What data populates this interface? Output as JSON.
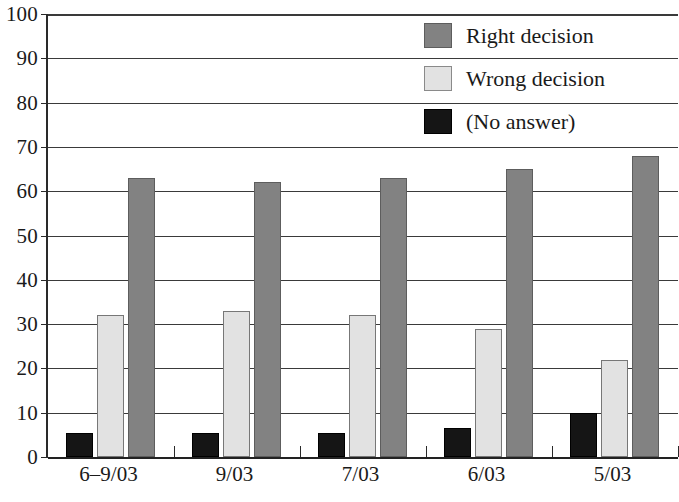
{
  "chart_data": {
    "type": "bar",
    "title": "",
    "xlabel": "",
    "ylabel": "",
    "ylim": [
      0,
      100
    ],
    "ytick_step": 10,
    "grid": true,
    "legend_position": "top-right",
    "orientation": "vertical",
    "grouping": "grouped",
    "categories": [
      "6–9/03",
      "9/03",
      "7/03",
      "6/03",
      "5/03"
    ],
    "ytick_labels": [
      "100",
      "90",
      "80",
      "70",
      "60",
      "50",
      "40",
      "30",
      "20",
      "10",
      "0"
    ],
    "ytick_values": [
      100,
      90,
      80,
      70,
      60,
      50,
      40,
      30,
      20,
      10,
      0
    ],
    "series": [
      {
        "name": "(No answer)",
        "color": "#151515",
        "values": [
          5.5,
          5.5,
          5.5,
          6.5,
          10
        ]
      },
      {
        "name": "Wrong decision",
        "color": "#e2e2e2",
        "values": [
          32,
          33,
          32,
          29,
          22
        ]
      },
      {
        "name": "Right decision",
        "color": "#828282",
        "values": [
          63,
          62,
          63,
          65,
          68
        ]
      }
    ]
  },
  "legend": {
    "entries": [
      {
        "label": "Right decision",
        "swatch": "series-right",
        "icon": "legend-swatch-right-decision"
      },
      {
        "label": "Wrong decision",
        "swatch": "series-wrong",
        "icon": "legend-swatch-wrong-decision"
      },
      {
        "label": "(No answer)",
        "swatch": "series-no-answer",
        "icon": "legend-swatch-no-answer"
      }
    ]
  }
}
